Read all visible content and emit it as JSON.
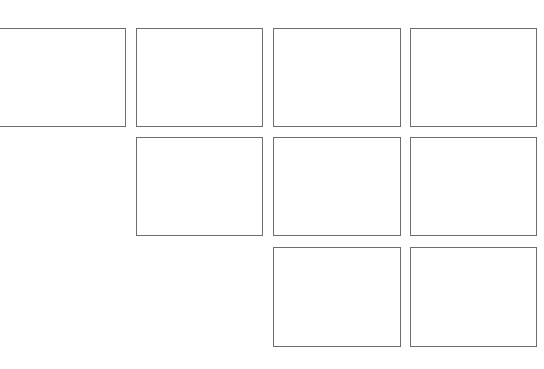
{
  "canvas": {
    "width": 544,
    "height": 369,
    "background": "#ffffff",
    "border_color": "#6e6e6e"
  },
  "grid": {
    "rows": 3,
    "columns": 4,
    "boxes": [
      {
        "row": 1,
        "col": 1,
        "x": -1,
        "y": 28,
        "w": 127,
        "h": 99
      },
      {
        "row": 1,
        "col": 2,
        "x": 136,
        "y": 28,
        "w": 127,
        "h": 99
      },
      {
        "row": 1,
        "col": 3,
        "x": 273,
        "y": 28,
        "w": 128,
        "h": 99
      },
      {
        "row": 1,
        "col": 4,
        "x": 410,
        "y": 28,
        "w": 127,
        "h": 99
      },
      {
        "row": 2,
        "col": 2,
        "x": 136,
        "y": 137,
        "w": 127,
        "h": 99
      },
      {
        "row": 2,
        "col": 3,
        "x": 273,
        "y": 137,
        "w": 128,
        "h": 99
      },
      {
        "row": 2,
        "col": 4,
        "x": 410,
        "y": 137,
        "w": 127,
        "h": 99
      },
      {
        "row": 3,
        "col": 3,
        "x": 273,
        "y": 247,
        "w": 128,
        "h": 100
      },
      {
        "row": 3,
        "col": 4,
        "x": 410,
        "y": 247,
        "w": 127,
        "h": 100
      }
    ]
  }
}
